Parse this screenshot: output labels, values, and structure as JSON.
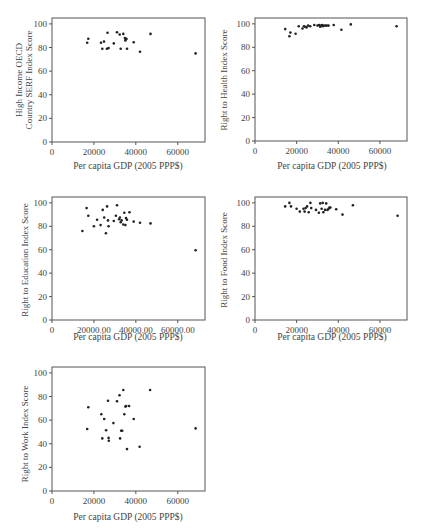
{
  "chart_data": [
    {
      "id": "oecd",
      "type": "scatter",
      "title": "",
      "xlabel": "Per capita GDP (2005 PPP$)",
      "ylabel": [
        "High Income OECD",
        "Country SERF Index Score"
      ],
      "xlim": [
        0,
        73000
      ],
      "ylim": [
        0,
        105
      ],
      "xticks": [
        0,
        20000,
        40000,
        60000
      ],
      "xtick_labels": [
        "0",
        "20000",
        "40000",
        "60000"
      ],
      "yticks": [
        0,
        20,
        40,
        60,
        80,
        100
      ],
      "grid": false,
      "points": [
        [
          16800,
          84
        ],
        [
          17300,
          87.5
        ],
        [
          23400,
          84
        ],
        [
          24000,
          79
        ],
        [
          24800,
          85
        ],
        [
          26200,
          79
        ],
        [
          26500,
          92.5
        ],
        [
          27000,
          79.5
        ],
        [
          29500,
          83.5
        ],
        [
          31000,
          93
        ],
        [
          32300,
          91
        ],
        [
          32800,
          79
        ],
        [
          34000,
          91.5
        ],
        [
          34800,
          88
        ],
        [
          35000,
          86
        ],
        [
          35300,
          87
        ],
        [
          35500,
          87.5
        ],
        [
          35800,
          79
        ],
        [
          39000,
          84.5
        ],
        [
          42000,
          76.5
        ],
        [
          47000,
          91.5
        ],
        [
          68500,
          75
        ]
      ]
    },
    {
      "id": "health",
      "type": "scatter",
      "title": "",
      "xlabel": "Per capita GDP (2005 PPP$)",
      "ylabel": [
        "Right to Health Index Score"
      ],
      "xlim": [
        0,
        73000
      ],
      "ylim": [
        0,
        105
      ],
      "xticks": [
        0,
        20000,
        40000,
        60000
      ],
      "xtick_labels": [
        "0",
        "20000",
        "40000",
        "60000"
      ],
      "yticks": [
        0,
        20,
        40,
        60,
        80,
        100
      ],
      "grid": false,
      "points": [
        [
          14500,
          95.5
        ],
        [
          16500,
          89.5
        ],
        [
          17000,
          92.5
        ],
        [
          19500,
          91.5
        ],
        [
          21000,
          98
        ],
        [
          22800,
          96
        ],
        [
          23500,
          98
        ],
        [
          24000,
          97.5
        ],
        [
          24800,
          97
        ],
        [
          25500,
          98.5
        ],
        [
          26500,
          98
        ],
        [
          28500,
          99
        ],
        [
          30000,
          98.5
        ],
        [
          30800,
          99
        ],
        [
          31300,
          97.5
        ],
        [
          31800,
          98.5
        ],
        [
          32200,
          99
        ],
        [
          32600,
          98
        ],
        [
          33000,
          98.5
        ],
        [
          33800,
          98.5
        ],
        [
          34500,
          98.5
        ],
        [
          35300,
          98.5
        ],
        [
          37800,
          99
        ],
        [
          41500,
          95
        ],
        [
          46000,
          99.5
        ],
        [
          68000,
          98
        ]
      ]
    },
    {
      "id": "education",
      "type": "scatter",
      "title": "",
      "xlabel": "Per capita GDP (2005 PPP$)",
      "ylabel": [
        "Right to Education Index Score"
      ],
      "xlim": [
        0,
        73000
      ],
      "ylim": [
        0,
        105
      ],
      "xticks": [
        0,
        20000,
        40000,
        60000
      ],
      "xtick_labels": [
        "0",
        "20000.00",
        "40000.00",
        "60000.00"
      ],
      "yticks": [
        0,
        20,
        40,
        60,
        80,
        100
      ],
      "grid": false,
      "points": [
        [
          14500,
          76
        ],
        [
          16500,
          95.5
        ],
        [
          17300,
          89
        ],
        [
          20000,
          80
        ],
        [
          21500,
          85.5
        ],
        [
          23200,
          81
        ],
        [
          24200,
          94
        ],
        [
          24900,
          87.5
        ],
        [
          25700,
          74
        ],
        [
          26300,
          97
        ],
        [
          26700,
          85
        ],
        [
          27000,
          80
        ],
        [
          29500,
          84.5
        ],
        [
          30500,
          89
        ],
        [
          31000,
          98
        ],
        [
          32000,
          86
        ],
        [
          32400,
          87.5
        ],
        [
          32800,
          83.5
        ],
        [
          33200,
          85
        ],
        [
          34000,
          81.5
        ],
        [
          34500,
          91.5
        ],
        [
          35000,
          81
        ],
        [
          35300,
          87
        ],
        [
          35800,
          85.5
        ],
        [
          37000,
          92
        ],
        [
          39000,
          84
        ],
        [
          42000,
          83
        ],
        [
          47000,
          82.5
        ],
        [
          68500,
          59.5
        ]
      ]
    },
    {
      "id": "food",
      "type": "scatter",
      "title": "",
      "xlabel": "Per capita GDP (2005 PPP$)",
      "ylabel": [
        "Right to Food Index Score"
      ],
      "xlim": [
        0,
        73000
      ],
      "ylim": [
        0,
        105
      ],
      "xticks": [
        0,
        20000,
        40000,
        60000
      ],
      "xtick_labels": [
        "0",
        "20000",
        "40000",
        "60000"
      ],
      "yticks": [
        0,
        20,
        40,
        60,
        80,
        100
      ],
      "grid": false,
      "points": [
        [
          14500,
          97
        ],
        [
          16500,
          100
        ],
        [
          17300,
          97
        ],
        [
          20000,
          95
        ],
        [
          21500,
          92.5
        ],
        [
          23300,
          95
        ],
        [
          23800,
          92.5
        ],
        [
          24300,
          95.5
        ],
        [
          25000,
          97
        ],
        [
          25800,
          92
        ],
        [
          26600,
          100
        ],
        [
          27000,
          95.5
        ],
        [
          29300,
          94
        ],
        [
          30700,
          91.5
        ],
        [
          31300,
          99.5
        ],
        [
          32000,
          95
        ],
        [
          32500,
          100
        ],
        [
          32800,
          92
        ],
        [
          33600,
          94
        ],
        [
          34200,
          99.5
        ],
        [
          34800,
          94
        ],
        [
          35400,
          95
        ],
        [
          35800,
          96
        ],
        [
          36200,
          96
        ],
        [
          39000,
          94.5
        ],
        [
          42000,
          90
        ],
        [
          47000,
          98
        ],
        [
          68500,
          89
        ]
      ]
    },
    {
      "id": "work",
      "type": "scatter",
      "title": "",
      "xlabel": "Per capita GDP (2005 PPP$)",
      "ylabel": [
        "Right to Work Index Score"
      ],
      "xlim": [
        0,
        73000
      ],
      "ylim": [
        0,
        105
      ],
      "xticks": [
        0,
        20000,
        40000,
        60000
      ],
      "xtick_labels": [
        "0",
        "20000",
        "40000",
        "60000"
      ],
      "yticks": [
        0,
        20,
        40,
        60,
        80,
        100
      ],
      "grid": false,
      "points": [
        [
          16800,
          52.5
        ],
        [
          17300,
          71
        ],
        [
          23500,
          65
        ],
        [
          24000,
          44.5
        ],
        [
          24900,
          61
        ],
        [
          25800,
          51.5
        ],
        [
          26700,
          76.5
        ],
        [
          27000,
          45
        ],
        [
          27100,
          42.5
        ],
        [
          29300,
          57.5
        ],
        [
          31000,
          76
        ],
        [
          32200,
          81
        ],
        [
          32500,
          44.5
        ],
        [
          33000,
          51
        ],
        [
          33500,
          51
        ],
        [
          34000,
          85.5
        ],
        [
          34500,
          65
        ],
        [
          35000,
          71.5
        ],
        [
          35400,
          72
        ],
        [
          35800,
          35.5
        ],
        [
          36800,
          72
        ],
        [
          39000,
          61
        ],
        [
          41800,
          37.5
        ],
        [
          46800,
          85.5
        ],
        [
          68500,
          53
        ]
      ]
    }
  ],
  "panels": {
    "oecd": {
      "ylabel_line1": "High Income OECD",
      "ylabel_line2": "Country SERF Index Score",
      "xlabel": "Per capita GDP (2005 PPP$)"
    },
    "health": {
      "ylabel_line1": "Right to Health Index Score",
      "xlabel": "Per capita GDP (2005 PPP$)"
    },
    "education": {
      "ylabel_line1": "Right to Education Index Score",
      "xlabel": "Per capita GDP (2005 PPP$)"
    },
    "food": {
      "ylabel_line1": "Right to Food Index Score",
      "xlabel": "Per capita GDP (2005 PPP$)"
    },
    "work": {
      "ylabel_line1": "Right to Work Index Score",
      "xlabel": "Per capita GDP (2005 PPP$)"
    }
  },
  "style": {
    "axis_color": "#555555",
    "marker_color": "#222222",
    "text_color": "#444444"
  }
}
